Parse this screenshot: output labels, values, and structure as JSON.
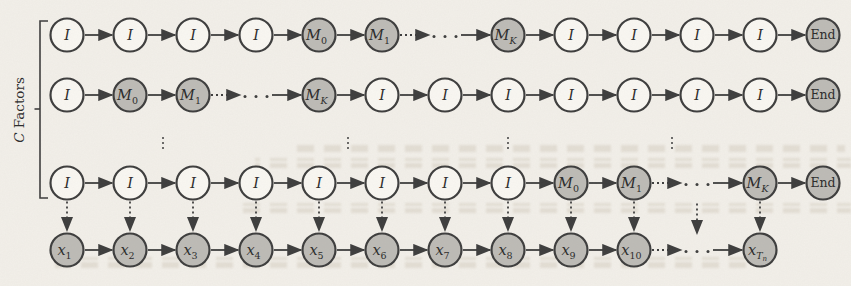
{
  "figure": {
    "bracket": {
      "label_italic": "C",
      "label_rest": " Factors"
    },
    "ellipsis_glyph": "⋯",
    "colors": {
      "background": "#f2efe9",
      "node_white": "#f9f7f2",
      "node_gray": "#bdbbb6",
      "stroke": "#3d3d3d",
      "text": "#2b2b2b"
    },
    "layout": {
      "width": 851,
      "height": 286,
      "cols": [
        67,
        130,
        193,
        256,
        319,
        382,
        445,
        508,
        571,
        634,
        697,
        760,
        823
      ],
      "row_y": [
        35,
        95,
        183,
        250
      ],
      "radius": 16.5,
      "bracket_geom": {
        "x": 40,
        "top": 21,
        "bottom": 198,
        "tick": 8,
        "mid_y": 109,
        "label_x": 19,
        "label_y": 110
      },
      "between_row_ellipsis_x": [
        163,
        348,
        508,
        672
      ],
      "between_row_ellipsis_y": 143,
      "obs_arrow_cols": [
        0,
        1,
        2,
        3,
        4,
        5,
        6,
        7,
        8,
        9,
        11
      ],
      "obs_arrow_dots_col": 10
    },
    "rows": [
      {
        "name": "factor-chain-1",
        "cells": [
          {
            "m": "I"
          },
          {
            "m": "I"
          },
          {
            "m": "I"
          },
          {
            "m": "I"
          },
          {
            "m": "M",
            "s": "0",
            "g": 1
          },
          {
            "m": "M",
            "s": "1",
            "g": 1
          },
          {
            "dots": 1
          },
          {
            "m": "M",
            "s": "K",
            "g": 1
          },
          {
            "m": "I"
          },
          {
            "m": "I"
          },
          {
            "m": "I"
          },
          {
            "m": "I"
          },
          {
            "m": "End",
            "g": 1,
            "u": 1
          }
        ]
      },
      {
        "name": "factor-chain-2",
        "cells": [
          {
            "m": "I"
          },
          {
            "m": "M",
            "s": "0",
            "g": 1
          },
          {
            "m": "M",
            "s": "1",
            "g": 1
          },
          {
            "dots": 1
          },
          {
            "m": "M",
            "s": "K",
            "g": 1
          },
          {
            "m": "I"
          },
          {
            "m": "I"
          },
          {
            "m": "I"
          },
          {
            "m": "I"
          },
          {
            "m": "I"
          },
          {
            "m": "I"
          },
          {
            "m": "I"
          },
          {
            "m": "End",
            "g": 1,
            "u": 1
          }
        ]
      },
      {
        "name": "factor-chain-C",
        "cells": [
          {
            "m": "I"
          },
          {
            "m": "I"
          },
          {
            "m": "I"
          },
          {
            "m": "I"
          },
          {
            "m": "I"
          },
          {
            "m": "I"
          },
          {
            "m": "I"
          },
          {
            "m": "I"
          },
          {
            "m": "M",
            "s": "0",
            "g": 1
          },
          {
            "m": "M",
            "s": "1",
            "g": 1
          },
          {
            "dots": 1
          },
          {
            "m": "M",
            "s": "K",
            "g": 1
          },
          {
            "m": "End",
            "g": 1,
            "u": 1
          }
        ]
      },
      {
        "name": "observation-chain",
        "cells": [
          {
            "m": "x",
            "s": "1",
            "g": 1
          },
          {
            "m": "x",
            "s": "2",
            "g": 1
          },
          {
            "m": "x",
            "s": "3",
            "g": 1
          },
          {
            "m": "x",
            "s": "4",
            "g": 1
          },
          {
            "m": "x",
            "s": "5",
            "g": 1
          },
          {
            "m": "x",
            "s": "6",
            "g": 1
          },
          {
            "m": "x",
            "s": "7",
            "g": 1
          },
          {
            "m": "x",
            "s": "8",
            "g": 1
          },
          {
            "m": "x",
            "s": "9",
            "g": 1
          },
          {
            "m": "x",
            "s": "10",
            "g": 1
          },
          {
            "dots": 1
          },
          {
            "m": "x",
            "s": "T",
            "ss": "n",
            "g": 1
          },
          null
        ]
      }
    ]
  }
}
